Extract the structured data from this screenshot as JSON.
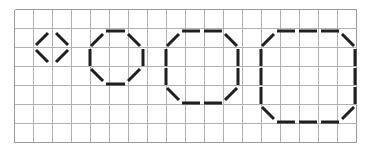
{
  "figure": {
    "type": "line-diagram",
    "canvas": {
      "width": 372,
      "height": 148,
      "background": "#ffffff"
    },
    "grid": {
      "origin_x": 14,
      "origin_y": 9,
      "cell": 19,
      "cols": 18,
      "rows": 7,
      "line_color": "#b0b0b0",
      "border_color": "#9a9a9a",
      "line_width": 1,
      "visible": true
    },
    "stroke": {
      "color": "#1f1f1f",
      "width": 3,
      "linecap": "butt"
    },
    "shapes": [
      {
        "name": "diamond-1",
        "label": "small diamond",
        "sides": 4,
        "grid_span_cols": [
          2,
          4
        ],
        "grid_span_rows": [
          1,
          3
        ],
        "segments": [
          {
            "name": "upper-left-diagonal",
            "x1": 36,
            "y1": 45,
            "x2": 48,
            "y2": 33
          },
          {
            "name": "upper-right-diagonal",
            "x1": 56,
            "y1": 33,
            "x2": 68,
            "y2": 45
          },
          {
            "name": "lower-left-diagonal",
            "x1": 36,
            "y1": 50,
            "x2": 48,
            "y2": 62
          },
          {
            "name": "lower-right-diagonal",
            "x1": 56,
            "y1": 62,
            "x2": 68,
            "y2": 50
          }
        ]
      },
      {
        "name": "octagon-2",
        "label": "small octagon",
        "sides": 8,
        "grid_span_cols": [
          4,
          7
        ],
        "grid_span_rows": [
          1,
          4
        ],
        "segments": [
          {
            "name": "top-edge",
            "x1": 106,
            "y1": 31,
            "x2": 125,
            "y2": 31
          },
          {
            "name": "top-left-diagonal",
            "x1": 91,
            "y1": 46,
            "x2": 103,
            "y2": 34
          },
          {
            "name": "top-right-diagonal",
            "x1": 128,
            "y1": 34,
            "x2": 140,
            "y2": 46
          },
          {
            "name": "left-edge",
            "x1": 90,
            "y1": 49,
            "x2": 90,
            "y2": 66
          },
          {
            "name": "right-edge",
            "x1": 143,
            "y1": 49,
            "x2": 143,
            "y2": 66
          },
          {
            "name": "bottom-left-diagonal",
            "x1": 91,
            "y1": 69,
            "x2": 103,
            "y2": 81
          },
          {
            "name": "bottom-right-diagonal",
            "x1": 128,
            "y1": 81,
            "x2": 140,
            "y2": 69
          },
          {
            "name": "bottom-edge",
            "x1": 106,
            "y1": 84,
            "x2": 125,
            "y2": 84
          }
        ]
      },
      {
        "name": "octagon-3",
        "label": "medium octagon",
        "sides": 8,
        "grid_span_cols": [
          8,
          12
        ],
        "grid_span_rows": [
          1,
          5
        ],
        "segments": [
          {
            "name": "top-edge-left",
            "x1": 182,
            "y1": 31,
            "x2": 200,
            "y2": 31
          },
          {
            "name": "top-edge-right",
            "x1": 204,
            "y1": 31,
            "x2": 222,
            "y2": 31
          },
          {
            "name": "top-left-diagonal",
            "x1": 167,
            "y1": 46,
            "x2": 179,
            "y2": 34
          },
          {
            "name": "top-right-diagonal",
            "x1": 225,
            "y1": 34,
            "x2": 237,
            "y2": 46
          },
          {
            "name": "left-edge-upper",
            "x1": 166,
            "y1": 49,
            "x2": 166,
            "y2": 66
          },
          {
            "name": "left-edge-lower",
            "x1": 166,
            "y1": 68,
            "x2": 166,
            "y2": 85
          },
          {
            "name": "right-edge-upper",
            "x1": 238,
            "y1": 49,
            "x2": 238,
            "y2": 66
          },
          {
            "name": "right-edge-lower",
            "x1": 238,
            "y1": 68,
            "x2": 238,
            "y2": 85
          },
          {
            "name": "bottom-left-diagonal",
            "x1": 167,
            "y1": 88,
            "x2": 179,
            "y2": 100
          },
          {
            "name": "bottom-right-diagonal",
            "x1": 225,
            "y1": 100,
            "x2": 237,
            "y2": 88
          },
          {
            "name": "bottom-edge-left",
            "x1": 182,
            "y1": 103,
            "x2": 200,
            "y2": 103
          },
          {
            "name": "bottom-edge-right",
            "x1": 204,
            "y1": 103,
            "x2": 222,
            "y2": 103
          }
        ]
      },
      {
        "name": "octagon-4",
        "label": "large octagon",
        "sides": 8,
        "grid_span_cols": [
          13,
          18
        ],
        "grid_span_rows": [
          1,
          6
        ],
        "segments": [
          {
            "name": "top-edge-left",
            "x1": 277,
            "y1": 31,
            "x2": 295,
            "y2": 31
          },
          {
            "name": "top-edge-center",
            "x1": 299,
            "y1": 31,
            "x2": 317,
            "y2": 31
          },
          {
            "name": "top-edge-right",
            "x1": 321,
            "y1": 31,
            "x2": 339,
            "y2": 31
          },
          {
            "name": "top-left-diagonal",
            "x1": 262,
            "y1": 46,
            "x2": 274,
            "y2": 34
          },
          {
            "name": "top-right-diagonal",
            "x1": 342,
            "y1": 34,
            "x2": 354,
            "y2": 46
          },
          {
            "name": "left-edge-upper",
            "x1": 261,
            "y1": 49,
            "x2": 261,
            "y2": 66
          },
          {
            "name": "left-edge-middle",
            "x1": 261,
            "y1": 68,
            "x2": 261,
            "y2": 85
          },
          {
            "name": "left-edge-lower",
            "x1": 261,
            "y1": 87,
            "x2": 261,
            "y2": 104
          },
          {
            "name": "right-edge-upper",
            "x1": 355,
            "y1": 49,
            "x2": 355,
            "y2": 66
          },
          {
            "name": "right-edge-middle",
            "x1": 355,
            "y1": 68,
            "x2": 355,
            "y2": 85
          },
          {
            "name": "right-edge-lower",
            "x1": 355,
            "y1": 87,
            "x2": 355,
            "y2": 104
          },
          {
            "name": "bottom-left-diagonal",
            "x1": 262,
            "y1": 107,
            "x2": 274,
            "y2": 119
          },
          {
            "name": "bottom-right-diagonal",
            "x1": 342,
            "y1": 119,
            "x2": 354,
            "y2": 107
          },
          {
            "name": "bottom-edge-left",
            "x1": 277,
            "y1": 122,
            "x2": 295,
            "y2": 122
          },
          {
            "name": "bottom-edge-center",
            "x1": 299,
            "y1": 122,
            "x2": 317,
            "y2": 122
          },
          {
            "name": "bottom-edge-right",
            "x1": 321,
            "y1": 122,
            "x2": 339,
            "y2": 122
          }
        ]
      }
    ]
  }
}
